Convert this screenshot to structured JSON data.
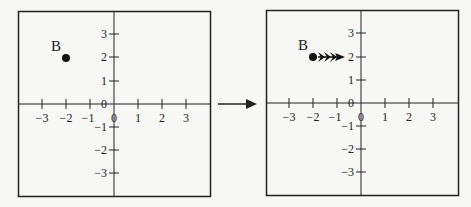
{
  "panels": [
    {
      "id": "before",
      "point_label": "B",
      "point": {
        "x": -2,
        "y": 2
      },
      "x_ticks": [
        "−3",
        "−2",
        "−1",
        "0",
        "1",
        "2",
        "3"
      ],
      "y_ticks": [
        "3",
        "2",
        "1",
        "0",
        "−1",
        "−2",
        "−3"
      ],
      "arrows": false
    },
    {
      "id": "after",
      "point_label": "B",
      "point": {
        "x": -2,
        "y": 2
      },
      "x_ticks": [
        "−3",
        "−2",
        "−1",
        "0",
        "1",
        "2",
        "3"
      ],
      "y_ticks": [
        "3",
        "2",
        "1",
        "0",
        "−1",
        "−2",
        "−3"
      ],
      "arrows": true,
      "arrow_direction": "right",
      "arrow_count": 3
    }
  ],
  "transition_arrow": "right",
  "colors": {
    "ink": "#222222",
    "background": "#f7f7f6"
  }
}
